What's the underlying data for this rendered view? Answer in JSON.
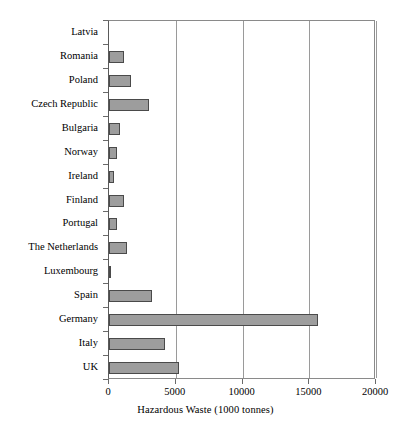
{
  "chart_data": {
    "type": "bar",
    "orientation": "horizontal",
    "title": "",
    "xlabel": "Hazardous Waste (1000 tonnes)",
    "ylabel": "",
    "xlim": [
      0,
      20000
    ],
    "xticks": [
      0,
      5000,
      10000,
      15000,
      20000
    ],
    "xticklabels": [
      "0",
      "5000",
      "10000",
      "15000",
      "20000"
    ],
    "grid": "vertical",
    "legend": "none",
    "bar_color": "#9d9d9d",
    "bar_edge_color": "#4a4a4a",
    "categories": [
      "Latvia",
      "Romania",
      "Poland",
      "Czech Republic",
      "Bulgaria",
      "Norway",
      "Ireland",
      "Finland",
      "Portugal",
      "The Netherlands",
      "Luxembourg",
      "Spain",
      "Germany",
      "Italy",
      "UK"
    ],
    "values": [
      0,
      1100,
      1650,
      3000,
      820,
      600,
      370,
      1150,
      620,
      1350,
      180,
      3200,
      15650,
      4200,
      5250
    ]
  }
}
